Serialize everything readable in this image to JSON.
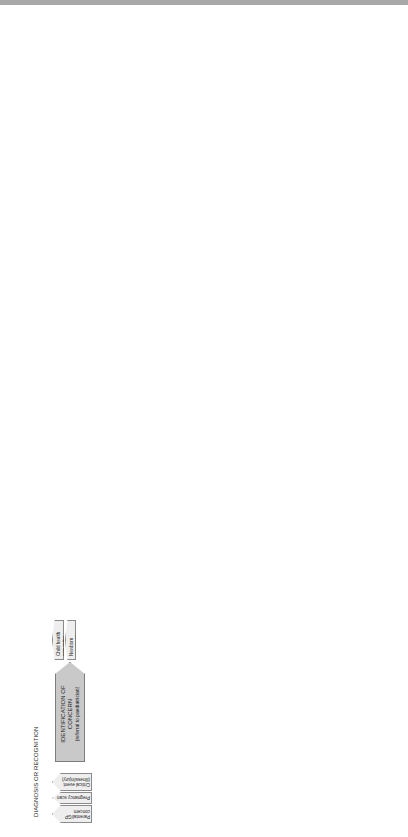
{
  "diagnosis": {
    "title": "DIAGNOSIS OR RECOGNITION",
    "triggers_left": [
      "Parental/GP concern",
      "Pregnancy scan",
      "Critical event (illness/injury)"
    ],
    "triggers_right": [
      "Child health screening",
      "Newborn examination"
    ],
    "steps": {
      "identification": {
        "label": "IDENTIFICATION OF CONCERN",
        "sub": "(referral to paediatrician)"
      },
      "clinical": {
        "label": "CLINICAL ASSESSMENT",
        "sub": "of the child"
      },
      "diagnosis": {
        "label": "DIAGNOSIS OR RECOGNITION",
        "sub": "of LTI or LLI condition/ prognosis"
      },
      "breaking": {
        "label": "BREAKING NEWS"
      },
      "planning": {
        "label": "PLANNING FOR GOING HOME"
      },
      "family_home": {
        "label": "FAMILY HOME"
      },
      "full_assessment": {
        "label": "FULL MULTI-AGENCY ASSESSMENT"
      }
    },
    "deterioration_tag": "Deterioration of long-term condition",
    "breaking_tags": [
      "Place/people",
      "Information",
      "Emotional support",
      "Interpreter"
    ],
    "first_standard": "THE FIRST STANDARD",
    "second_standard": "THE SECOND STANDARD",
    "panels": {
      "family": {
        "header": "FAMILY CARERS",
        "items": [
          "Immediate needs:",
          "Information",
          "Training",
          "Transport"
        ]
      },
      "child": {
        "header": "CHILD/YOUNG PERSON",
        "items": [
          "Immediate needs:",
          "Symptom control",
          "Medication",
          "Equipment",
          "Information",
          "Follow-up"
        ]
      },
      "liaison": {
        "header": "EARLY LIAISON MEETING",
        "items": [
          "Family",
          "GP and Primary Care team",
          "Hospital team",
          "Multi-disciplinary",
          "Community team",
          "Social Services"
        ]
      }
    },
    "continues": "(continues Pathway 2)"
  },
  "living": {
    "title": "LIVING WITH A LIFE-THREATENING OR LIFE-LIMITING CONDITION",
    "third_standard": "THE THIRD STANDARD",
    "fourth_standard": "THE FOURTH STANDARD",
    "assessment": {
      "label": "MULTI-AGENCY ASSESSMENT OF CHILD & FAMILY NEEDS"
    },
    "care_plan": {
      "label": "MULTI-AGENCY CARE PLAN",
      "sub": "Interventions"
    },
    "assessment_panels": {
      "family": {
        "header": "FAMILY CARERS",
        "items": [
          "Information needs",
          "Financial review",
          "Emotional needs",
          "Sibling well-being",
          "Family functioning",
          "Respite/short breaks",
          "Quality of life",
          "Interpreter",
          "Transition to adult services",
          "Genetic counselling"
        ]
      },
      "child": {
        "header": "CHILD/YOUNG PERSON",
        "items": [
          "Symptoms/pain",
          "Personal care needs",
          "Therapies",
          "Emotional support",
          "Information",
          "Short breaks",
          "School/leisure",
          "Quality of life",
          "YP transition plan",
          "Independent living needs"
        ]
      },
      "environment": {
        "header": "ENVIRONMENT",
        "items": [
          "Home assessment",
          "Equipment needs",
          "Transport needs",
          "School",
          "University/college"
        ]
      }
    },
    "plan_panels": {
      "family": {
        "header": "FAMILY CARERS",
        "items": [
          "Psychological support",
          "Training",
          "Access to benefits",
          "Parent support group",
          "Sibling group",
          "Respite/short breaks",
          "Pharmacy/supplies"
        ]
      },
      "child": {
        "header": "CHILD/YOUNG PERSON",
        "items": [
          "Symptom management",
          "Personal care",
          "Nursing support",
          "Educational support",
          "Social and leisure activities",
          "Short breaks",
          "Psychological support",
          "Independent living advice (YP)"
        ]
      },
      "environment": {
        "header": "ENVIRONMENT",
        "items": [
          "Home adaptations",
          "Aids/equipment",
          "Mobility"
        ]
      }
    },
    "leads": [
      "Clinical Lead",
      "Family GP"
    ],
    "admission": "Acute or planned admission",
    "discharge": "Discharge back to Community team",
    "review_needs": "REVIEW OF NEEDS",
    "review_prognosis": "REVIEW OF PROGNOSIS",
    "recognition": "RECOGNITION OF END OF LIFE",
    "continues": "(continues Pathway 3)"
  },
  "end_of_life": {
    "title": "END OF LIFE AND BEREAVEMENT",
    "recognition": "RECOGNITION OF END OF LIFE",
    "assessment": "ASSESSMENT OF END OF LIFE NEEDS AND WISHES",
    "plan": "END OF LIFE PLAN",
    "death": "DEATH",
    "post_death": "POST DEATH",
    "fifth_standard": "THE FIFTH STANDARD",
    "organ_tag": "Organ donation",
    "plan_panels": {
      "family": {
        "header": "FAMILY CARERS",
        "items": [
          "Practical support",
          "Sibling involvement",
          "Emotional support",
          "Spiritual issues",
          "Cultural/religious issues",
          "Funeral planning",
          "Organ donation",
          "Grandparents"
        ]
      },
      "child": {
        "header": "CHILD/YOUNG PERSON",
        "items": [
          "Pain/symptom control",
          "Quality of life",
          "Friends",
          "Emotional support",
          "Spiritual issues",
          "Cultural/religious issues",
          "Funeral planning",
          "Organ donation",
          "Resuscitation plan",
          "Special wishes/visits",
          "Memory box"
        ]
      },
      "environment": {
        "header": "ENVIRONMENT",
        "items": [
          "Place of death",
          "Ambience",
          "Place after death"
        ]
      }
    },
    "death_panels": {
      "family": {
        "header": "FAMILY CARERS",
        "items": [
          "Family support",
          "Practical help",
          "Sibling care",
          "Contacts",
          "Bereavement support"
        ]
      },
      "child": {
        "header": "CHILD/YOUNG PERSON",
        "items": [
          "Funeral",
          "Burial/cremation"
        ]
      },
      "environment": {
        "header": "ENVIRONMENT",
        "items": [
          "Place to be with the body",
          "Ambience"
        ]
      }
    }
  }
}
